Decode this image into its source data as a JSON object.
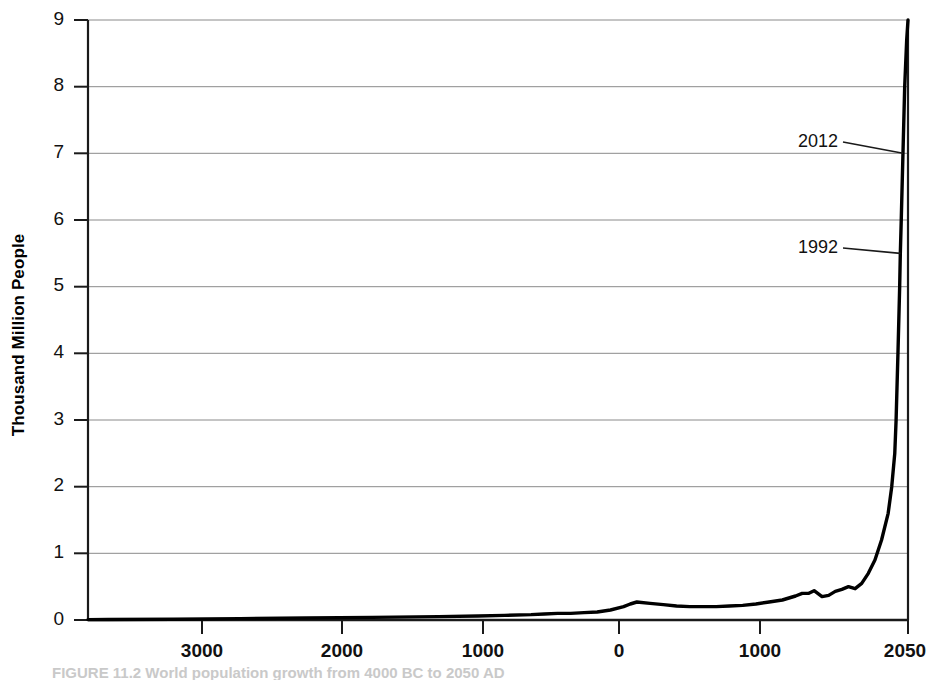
{
  "chart_data": {
    "type": "line",
    "title": "",
    "xlabel": "",
    "ylabel": "Thousand Million People",
    "ylim": [
      0,
      9
    ],
    "xlim": [
      -4150,
      2050
    ],
    "grid": true,
    "legend": null,
    "y_ticks": [
      "0",
      "1",
      "2",
      "3",
      "4",
      "5",
      "6",
      "7",
      "8",
      "9"
    ],
    "y_tick_values": [
      0,
      1,
      2,
      3,
      4,
      5,
      6,
      7,
      8,
      9
    ],
    "x_ticks": [
      "3000",
      "2000",
      "1000",
      "0",
      "1000",
      "2050"
    ],
    "x_tick_values": [
      -3000,
      -2000,
      -1000,
      0,
      1000,
      2050
    ],
    "annotations": [
      {
        "label": "2012",
        "x": 2012,
        "y": 7.0
      },
      {
        "label": "1992",
        "x": 1992,
        "y": 5.5
      }
    ],
    "series": [
      {
        "name": "World population",
        "x": [
          -4150,
          -4000,
          -3500,
          -3000,
          -2500,
          -2000,
          -1500,
          -1200,
          -1000,
          -800,
          -700,
          -600,
          -500,
          -400,
          -300,
          -200,
          -100,
          -50,
          0,
          100,
          200,
          300,
          400,
          500,
          600,
          700,
          800,
          900,
          1000,
          1100,
          1200,
          1250,
          1300,
          1340,
          1400,
          1450,
          1500,
          1550,
          1600,
          1650,
          1700,
          1750,
          1800,
          1850,
          1900,
          1927,
          1950,
          1960,
          1974,
          1987,
          1992,
          1999,
          2012,
          2025,
          2040,
          2050
        ],
        "y": [
          0.005,
          0.007,
          0.012,
          0.02,
          0.03,
          0.04,
          0.05,
          0.06,
          0.07,
          0.08,
          0.09,
          0.1,
          0.1,
          0.11,
          0.12,
          0.15,
          0.2,
          0.24,
          0.27,
          0.25,
          0.23,
          0.21,
          0.2,
          0.2,
          0.2,
          0.21,
          0.22,
          0.24,
          0.27,
          0.3,
          0.36,
          0.4,
          0.4,
          0.44,
          0.35,
          0.37,
          0.43,
          0.46,
          0.5,
          0.47,
          0.55,
          0.7,
          0.9,
          1.2,
          1.6,
          2.0,
          2.5,
          3.0,
          4.0,
          5.0,
          5.5,
          6.0,
          7.0,
          8.0,
          8.7,
          9.0
        ]
      }
    ]
  },
  "axis": {
    "y_title": "Thousand Million People"
  },
  "caption": {
    "text": "FIGURE 11.2  World population growth from 4000 BC to 2050 AD"
  },
  "colors": {
    "curve": "#000000",
    "gridline": "#8a8a8a",
    "axis": "#000000",
    "text": "#111111",
    "background": "#ffffff"
  }
}
